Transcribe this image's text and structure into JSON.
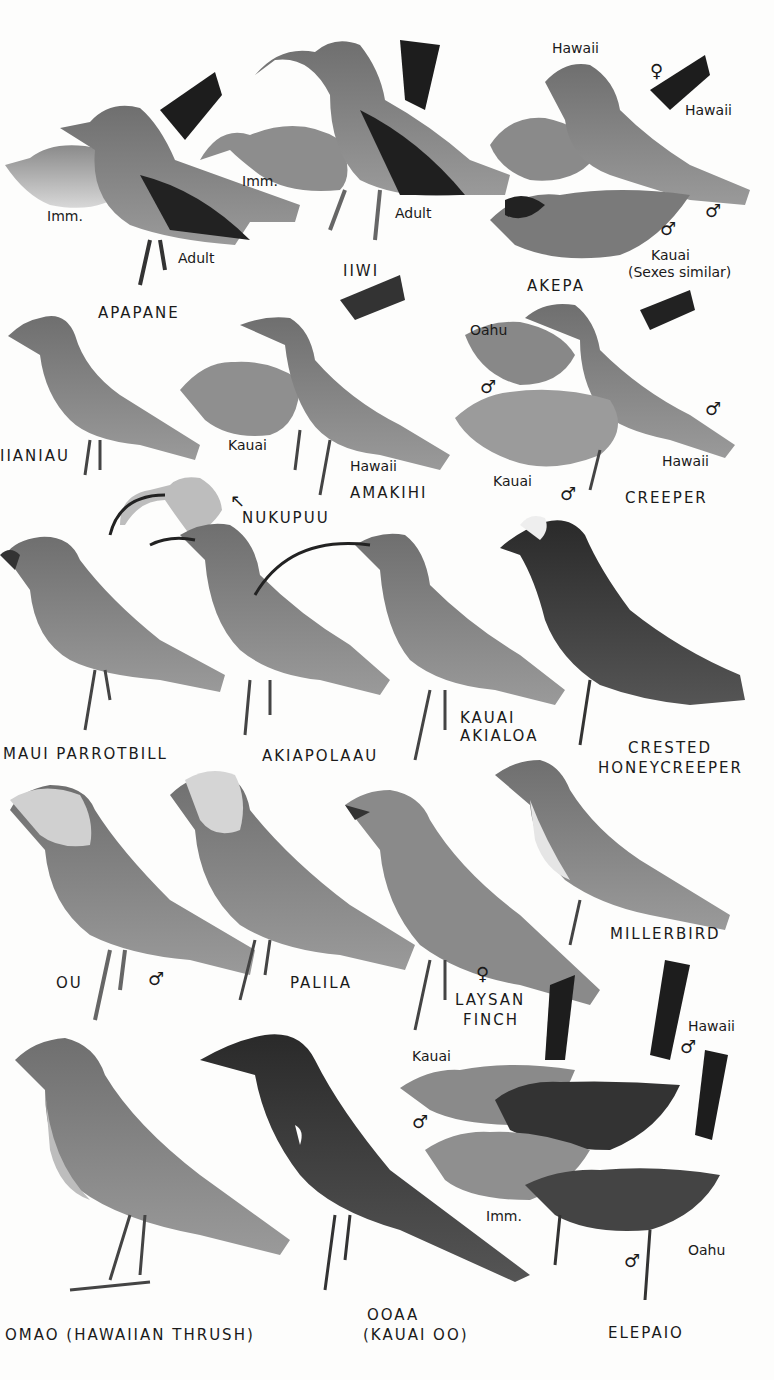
{
  "plate": {
    "species": [
      {
        "name": "APAPANE",
        "sublabels": [
          "Imm.",
          "Adult"
        ]
      },
      {
        "name": "IIWI",
        "sublabels": [
          "Imm.",
          "Adult"
        ]
      },
      {
        "name": "AKEPA",
        "sublabels": [
          "Hawaii",
          "♀",
          "Hawaii",
          "♂",
          "♂",
          "Kauai",
          "(Sexes similar)"
        ]
      },
      {
        "name": "IIANIAU",
        "sublabels": []
      },
      {
        "name": "AMAKIHI",
        "sublabels": [
          "Kauai",
          "Hawaii"
        ]
      },
      {
        "name": "CREEPER",
        "sublabels": [
          "Oahu",
          "♂",
          "♂",
          "Hawaii",
          "Kauai",
          "♂"
        ]
      },
      {
        "name": "NUKUPUU",
        "sublabels": [
          "↖"
        ]
      },
      {
        "name": "MAUI PARROTBILL",
        "sublabels": []
      },
      {
        "name": "AKIAPOLAAU",
        "sublabels": []
      },
      {
        "name": "KAUAI AKIALOA",
        "sublabels": []
      },
      {
        "name": "CRESTED HONEYCREEPER",
        "sublabels": []
      },
      {
        "name": "OU",
        "sublabels": [
          "♂"
        ]
      },
      {
        "name": "PALILA",
        "sublabels": []
      },
      {
        "name": "LAYSAN FINCH",
        "sublabels": [
          "♀"
        ]
      },
      {
        "name": "MILLERBIRD",
        "sublabels": []
      },
      {
        "name": "OMAO (HAWAIIAN THRUSH)",
        "sublabels": []
      },
      {
        "name": "OOAA (KAUAI OO)",
        "sublabels": []
      },
      {
        "name": "ELEPAIO",
        "sublabels": [
          "Kauai",
          "♂",
          "Hawaii",
          "♂",
          "Imm.",
          "Oahu",
          "♂"
        ]
      }
    ]
  },
  "labels": {
    "apapane": "APAPANE",
    "apapane_imm": "Imm.",
    "apapane_adult": "Adult",
    "iiwi": "IIWI",
    "iiwi_imm": "Imm.",
    "iiwi_adult": "Adult",
    "akepa": "AKEPA",
    "akepa_hawaii_f": "Hawaii",
    "akepa_female": "♀",
    "akepa_hawaii_m": "Hawaii",
    "akepa_male1": "♂",
    "akepa_male2": "♂",
    "akepa_kauai": "Kauai",
    "akepa_note": "(Sexes similar)",
    "anianiau": "IIANIAU",
    "amakihi": "AMAKIHI",
    "amakihi_kauai": "Kauai",
    "amakihi_hawaii": "Hawaii",
    "creeper": "CREEPER",
    "creeper_oahu": "Oahu",
    "creeper_male_oahu": "♂",
    "creeper_male_hawaii": "♂",
    "creeper_hawaii": "Hawaii",
    "creeper_kauai": "Kauai",
    "creeper_male_kauai": "♂",
    "nukupuu": "NUKUPUU",
    "nukupuu_arrow": "↖",
    "parrotbill": "MAUI PARROTBILL",
    "akiapolaau": "AKIAPOLAAU",
    "akialoa_1": "KAUAI",
    "akialoa_2": "AKIALOA",
    "crested_1": "CRESTED",
    "crested_2": "HONEYCREEPER",
    "ou": "OU",
    "ou_male": "♂",
    "palila": "PALILA",
    "laysan_female": "♀",
    "laysan_1": "LAYSAN",
    "laysan_2": "FINCH",
    "millerbird": "MILLERBIRD",
    "omao": "OMAO (HAWAIIAN THRUSH)",
    "ooaa_1": "OOAA",
    "ooaa_2": "(KAUAI OO)",
    "elepaio": "ELEPAIO",
    "elepaio_kauai": "Kauai",
    "elepaio_kauai_male": "♂",
    "elepaio_hawaii": "Hawaii",
    "elepaio_hawaii_male": "♂",
    "elepaio_imm": "Imm.",
    "elepaio_oahu": "Oahu",
    "elepaio_oahu_male": "♂"
  }
}
